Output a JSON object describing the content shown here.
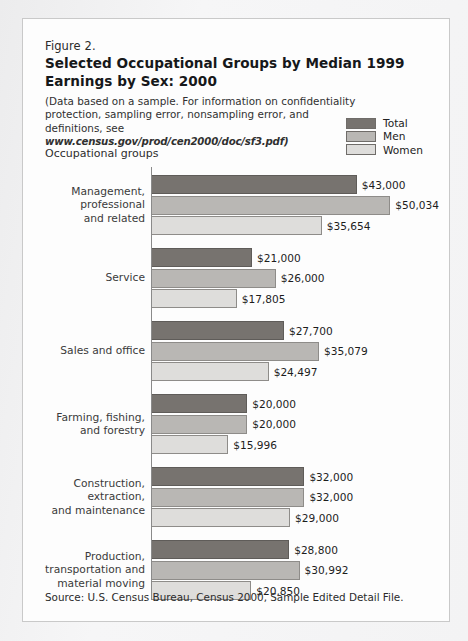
{
  "figure": {
    "label": "Figure 2.",
    "title": "Selected Occupational Groups by Median 1999 Earnings by Sex:  2000",
    "note_line1": "(Data based on a sample.  For information on confidentiality protection,",
    "note_line2": "sampling error, nonsampling error, and definitions, see",
    "note_url": "www.census.gov/prod/cen2000/doc/sf3.pdf)",
    "axis_title": "Occupational groups",
    "source": "Source:  U.S. Census Bureau, Census 2000, Sample Edited Detail File."
  },
  "legend": {
    "items": [
      {
        "label": "Total",
        "color": "#77736f"
      },
      {
        "label": "Men",
        "color": "#b9b7b4"
      },
      {
        "label": "Women",
        "color": "#dedddb"
      }
    ]
  },
  "colors": {
    "total": "#77736f",
    "men": "#b9b7b4",
    "women": "#dedddb",
    "axis": "#8a8a8a",
    "card_background": "#fdfdfd",
    "card_border": "#c9c9c9",
    "page_background": "#f2f2f3"
  },
  "chart_data": {
    "type": "bar",
    "orientation": "horizontal",
    "title": "Selected Occupational Groups by Median 1999 Earnings by Sex:  2000",
    "xlabel": "",
    "ylabel": "Occupational groups",
    "xlim": [
      0,
      52000
    ],
    "grid": false,
    "legend_position": "top-right",
    "value_prefix": "$",
    "categories": [
      "Management, professional and related",
      "Service",
      "Sales and office",
      "Farming, fishing, and forestry",
      "Construction, extraction, and maintenance",
      "Production, transportation and material moving"
    ],
    "category_label_lines": [
      [
        "Management,",
        "professional",
        "and related"
      ],
      [
        "Service"
      ],
      [
        "Sales and office"
      ],
      [
        "Farming, fishing,",
        "and forestry"
      ],
      [
        "Construction,",
        "extraction,",
        "and maintenance"
      ],
      [
        "Production,",
        "transportation and",
        "material moving"
      ]
    ],
    "series": [
      {
        "name": "Total",
        "values": [
          43000,
          21000,
          27700,
          20000,
          32000,
          28800
        ],
        "labels": [
          "$43,000",
          "$21,000",
          "$27,700",
          "$20,000",
          "$32,000",
          "$28,800"
        ]
      },
      {
        "name": "Men",
        "values": [
          50034,
          26000,
          35079,
          20000,
          32000,
          30992
        ],
        "labels": [
          "$50,034",
          "$26,000",
          "$35,079",
          "$20,000",
          "$32,000",
          "$30,992"
        ]
      },
      {
        "name": "Women",
        "values": [
          35654,
          17805,
          24497,
          15996,
          29000,
          20850
        ],
        "labels": [
          "$35,654",
          "$17,805",
          "$24,497",
          "$15,996",
          "$29,000",
          "$20,850"
        ]
      }
    ]
  }
}
